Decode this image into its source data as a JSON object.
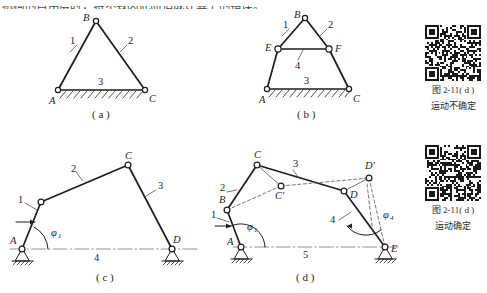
{
  "page": {
    "top_text_fragment": "机构的自由度时，将不致因此而造成计算上的错误。",
    "width": 487,
    "height": 293
  },
  "figures": [
    {
      "id": "a",
      "caption": "( a )",
      "joint_labels": [
        "B",
        "A",
        "C"
      ],
      "link_numbers": [
        "1",
        "2",
        "3"
      ],
      "description": "triangle-truss-fixed-base"
    },
    {
      "id": "b",
      "caption": "( b )",
      "joint_labels": [
        "B",
        "E",
        "F",
        "A",
        "C"
      ],
      "link_numbers": [
        "1",
        "2",
        "3",
        "4"
      ],
      "description": "triangle-truss-with-redundant-bar"
    },
    {
      "id": "c",
      "caption": "( c )",
      "joint_labels": [
        "A",
        "C",
        "D"
      ],
      "link_numbers": [
        "1",
        "2",
        "3",
        "4"
      ],
      "angle_labels": [
        {
          "symbol": "φ",
          "sub": "1"
        }
      ],
      "description": "four-bar-linkage-uncertain-motion"
    },
    {
      "id": "d",
      "caption": "( d )",
      "joint_labels": [
        "A",
        "B",
        "C",
        "C'",
        "D",
        "D'",
        "E"
      ],
      "link_numbers": [
        "1",
        "2",
        "3",
        "4",
        "5"
      ],
      "angle_labels": [
        {
          "symbol": "φ",
          "sub": "1"
        },
        {
          "symbol": "φ",
          "sub": "4"
        }
      ],
      "description": "five-bar-linkage-determined-motion"
    }
  ],
  "qr_panels": [
    {
      "name": "qr-top",
      "figure_ref": "图 2-11( d )",
      "note": "运动不确定"
    },
    {
      "name": "qr-bottom",
      "figure_ref": "图 2-11( d )",
      "note": "运动确定"
    }
  ],
  "colors": {
    "ink": "#1d1d1d",
    "paper": "#ffffff",
    "leader": "#3a3a3a",
    "centerline": "#777777"
  }
}
